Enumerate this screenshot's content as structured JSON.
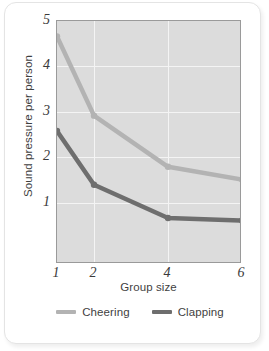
{
  "chart_data": {
    "type": "line",
    "title": "",
    "xlabel": "Group size",
    "ylabel": "Sound pressure per person",
    "x": [
      1,
      2,
      4,
      6
    ],
    "categories": [
      "1",
      "2",
      "4",
      "6"
    ],
    "xtick_labels": [
      "1",
      "2",
      "4",
      "6"
    ],
    "ytick_labels": [
      "1",
      "2",
      "3",
      "4",
      "5"
    ],
    "xlim": [
      1,
      6
    ],
    "ylim": [
      0.25,
      5.0
    ],
    "grid": true,
    "legend_position": "bottom",
    "series": [
      {
        "name": "Cheering",
        "color": "#b3b3b3",
        "values": [
          4.7,
          3.15,
          2.15,
          1.9
        ]
      },
      {
        "name": "Clapping",
        "color": "#6e6e6e",
        "values": [
          2.85,
          1.8,
          1.15,
          1.1
        ]
      }
    ]
  },
  "legend": {
    "items": [
      {
        "label": "Cheering",
        "color": "#b3b3b3"
      },
      {
        "label": "Clapping",
        "color": "#6e6e6e"
      }
    ]
  },
  "style": {
    "plot_background": "#dcdcdc",
    "gridline_color": "#f4f4f4",
    "axis_color": "#9a9a9a",
    "text_color": "#3f3f3f",
    "card_background": "#ffffff"
  }
}
